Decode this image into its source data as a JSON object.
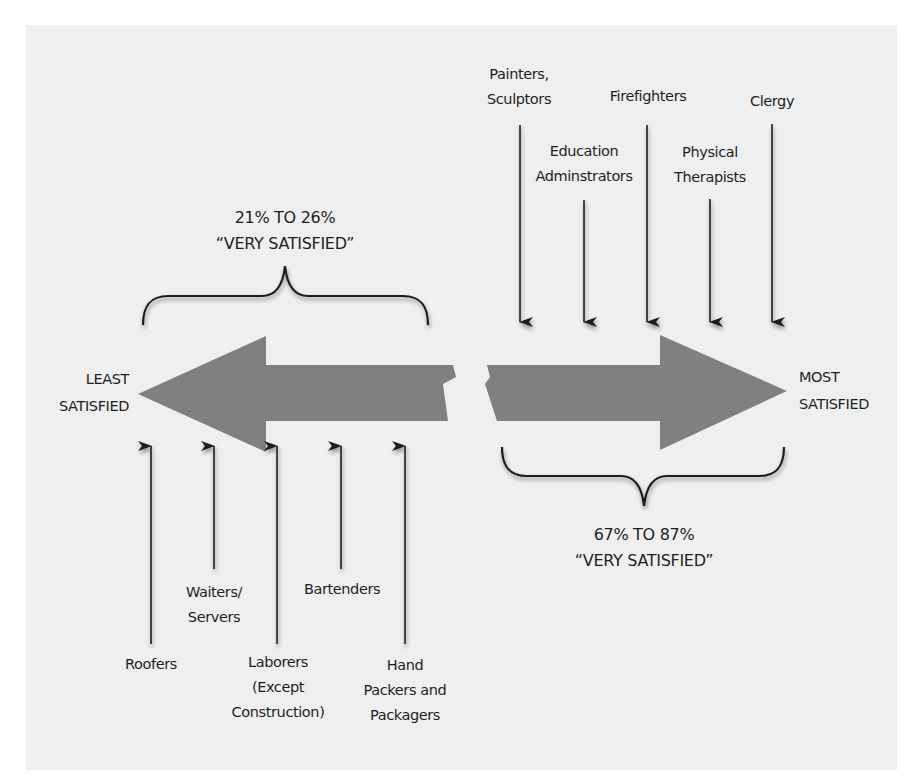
{
  "diagram": {
    "colors": {
      "background": "#ffffff",
      "panel": "#efefef",
      "arrow_fill": "#808080",
      "line": "#1e1e1e",
      "text": "#1e1e1e"
    },
    "scale": {
      "left_pole": {
        "line1": "LEAST",
        "line2": "SATISFIED"
      },
      "right_pole": {
        "line1": "MOST",
        "line2": "SATISFIED"
      }
    },
    "ranges": {
      "least": {
        "line1": "21% TO 26%",
        "line2": "“VERY SATISFIED”"
      },
      "most": {
        "line1": "67% TO 87%",
        "line2": "“VERY SATISFIED”"
      }
    },
    "least_satisfied_jobs": [
      {
        "label_lines": [
          "Roofers"
        ]
      },
      {
        "label_lines": [
          "Waiters/",
          "Servers"
        ]
      },
      {
        "label_lines": [
          "Laborers",
          "(Except",
          "Construction)"
        ]
      },
      {
        "label_lines": [
          "Bartenders"
        ]
      },
      {
        "label_lines": [
          "Hand",
          "Packers and",
          "Packagers"
        ]
      }
    ],
    "most_satisfied_jobs": [
      {
        "label_lines": [
          "Painters,",
          "Sculptors"
        ]
      },
      {
        "label_lines": [
          "Education",
          "Adminstrators"
        ]
      },
      {
        "label_lines": [
          "Firefighters"
        ]
      },
      {
        "label_lines": [
          "Physical",
          "Therapists"
        ]
      },
      {
        "label_lines": [
          "Clergy"
        ]
      }
    ]
  }
}
